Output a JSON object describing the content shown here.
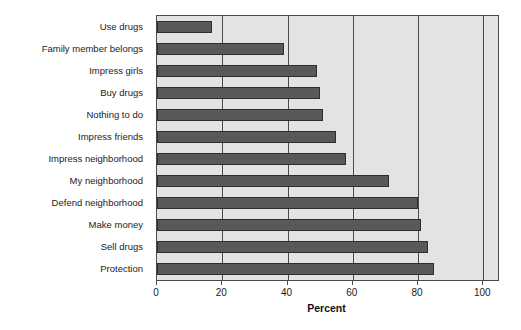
{
  "chart_data": {
    "type": "bar",
    "orientation": "horizontal",
    "title": "",
    "xlabel": "Percent",
    "ylabel": "",
    "categories": [
      "Use drugs",
      "Family member belongs",
      "Impress girls",
      "Buy drugs",
      "Nothing to do",
      "Impress friends",
      "Impress neighborhood",
      "My neighborhood",
      "Defend neighborhood",
      "Make money",
      "Sell drugs",
      "Protection"
    ],
    "values": [
      17,
      39,
      49,
      50,
      51,
      55,
      58,
      71,
      80,
      81,
      83,
      85
    ],
    "x_ticks": [
      0,
      20,
      40,
      60,
      80,
      100
    ],
    "x_tick_labels": [
      "0",
      "20",
      "40",
      "60",
      "80",
      "100"
    ],
    "xlim": [
      0,
      104.5
    ],
    "grid": true,
    "legend": false,
    "colors": {
      "bar_fill": "#595959",
      "bar_border": "#2e2e2e",
      "plot_background": "#e3e3e3",
      "frame_and_grid": "#4a4a4a",
      "page_background": "#ffffff",
      "text": "#1c1c1c"
    }
  }
}
